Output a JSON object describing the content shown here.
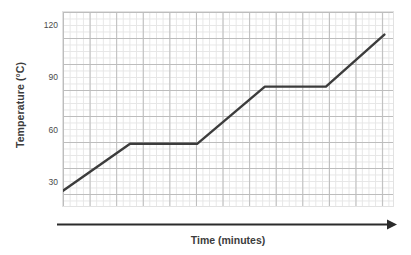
{
  "chart_data": {
    "type": "line",
    "title": "",
    "xlabel": "Time (minutes)",
    "ylabel": "Temperature (°C)",
    "ytick_labels": [
      "120",
      "90",
      "60",
      "30"
    ],
    "ytick_values": [
      120,
      90,
      60,
      30
    ],
    "ylim": [
      20,
      133
    ],
    "xlim": [
      0,
      50
    ],
    "grid": true,
    "grid_minor": true,
    "legend": "none",
    "series": [
      {
        "name": "Temperature",
        "color": "#3c3c3c",
        "x": [
          0,
          10.1,
          20.2,
          30.4,
          39.6,
          48.4
        ],
        "y": [
          30,
          57,
          57,
          90,
          90,
          120
        ]
      }
    ]
  },
  "axes": {
    "x_arrow": "arrow-right",
    "y_tick_marks": 4
  },
  "colors": {
    "line": "#3c3c3c",
    "grid_minor": "#e6e6e6",
    "grid_major": "#bdbdbd",
    "axis": "#2b2b2b",
    "text": "#3c3c3c",
    "tick_text": "#4a4a4a"
  }
}
